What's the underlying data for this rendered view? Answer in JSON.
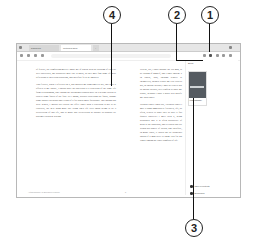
{
  "callouts": [
    {
      "number": "1",
      "label": "1"
    },
    {
      "number": "2",
      "label": "2"
    },
    {
      "number": "3",
      "label": "3"
    },
    {
      "number": "4",
      "label": "4"
    }
  ],
  "browser": {
    "tabs": [
      {
        "label": "Dashboard",
        "active": false
      },
      {
        "label": "Gutenberg Book",
        "active": true
      }
    ],
    "url": ""
  },
  "reader": {
    "left_page": {
      "paragraphs": [
        "of felicity, the comforting moves I made me of which with the blessing of God we well succeeded, my prosperity may like is know, as they may find some of these reflections to their own situations, and therefore fit to be imitated.",
        "That felicity, when I reflected on it, has induced me sometimes to say, that were it offered to my choice, I should have no objection to a repetition of the same life from its beginning, only asking the advantages authors have in a second edition to correct some faults of the first. So I might, besides correcting the faults, change some sinister accidents and events of it for others more favourable. But though this were denied, I should still accept the offer. Since such a repetition is not to be expected, the next thing most like living one's life over again seems to be a recollection of that life, and to make that recollection as durable as possible by putting it down in writing."
      ]
    },
    "right_page": {
      "paragraphs": [
        "Hereby, too, I shall indulge the old man, to be talking of himself, and I shall indulge it in others, who, through respect to themselves, obliged to give me a be read or not, as anyone pleases; I may be read or not as anyone pleases, well confess to since my denial, perhaps I shall a good deal gratify my own vanity.",
        "Without vanity I may say, \"Without vanity I may a thing immediately followed, life, so often, related to since they be give it fair quarter wherever I meet with it, being persuaded that it is often productive of good to the possessor, and to others that are within his sphere of action; and therefore, in many cases, it would not be altogether absurd if a man were to thank God for his vanity among the other comforts of life."
      ]
    },
    "status_left": "Autobiography of Benjamin Franklin",
    "page_number": "5"
  },
  "side_panel": {
    "title": "Book",
    "book_caption": "Autobiography",
    "items": [
      {
        "label": "Table of contents"
      },
      {
        "label": "Bookmarks"
      }
    ]
  }
}
